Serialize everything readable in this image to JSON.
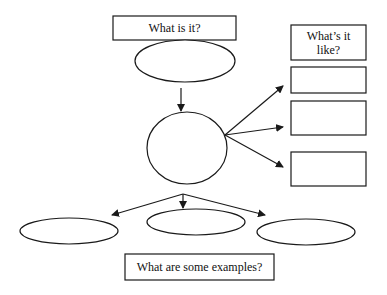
{
  "diagram": {
    "type": "concept-map",
    "stroke_color": "#1a1a1a",
    "top_box": {
      "label": "What is it?"
    },
    "right_header": {
      "label": "What’s it like?"
    },
    "bottom_box": {
      "label": "What are some examples?"
    },
    "nodes": {
      "definition_ellipse": {
        "label": ""
      },
      "center_circle": {
        "label": ""
      },
      "property_boxes": [
        {
          "label": ""
        },
        {
          "label": ""
        },
        {
          "label": ""
        }
      ],
      "example_ellipses": [
        {
          "label": ""
        },
        {
          "label": ""
        },
        {
          "label": ""
        }
      ]
    }
  }
}
